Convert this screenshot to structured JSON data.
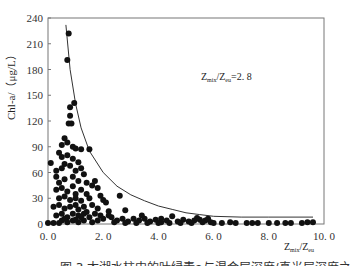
{
  "chart_data": {
    "type": "scatter",
    "title": "",
    "xlabel": "Zmix/Zeu",
    "ylabel": "Chl-a/（μg/L）",
    "xlim": [
      0,
      10
    ],
    "ylim": [
      0,
      240
    ],
    "xticks": [
      "0.0",
      "2.0",
      "4.0",
      "6.0",
      "8.0",
      "10.0"
    ],
    "yticks": [
      "0",
      "30",
      "60",
      "90",
      "120",
      "150",
      "180",
      "210",
      "240"
    ],
    "grid": false,
    "legend": null,
    "annotations": [
      {
        "text": "Zmix/Zeu=2.8",
        "x": 5.6,
        "y": 195
      }
    ],
    "series": [
      {
        "name": "observations",
        "marker": "filled-circle",
        "points": [
          [
            0.75,
            222
          ],
          [
            0.7,
            191
          ],
          [
            0.95,
            141
          ],
          [
            0.8,
            136
          ],
          [
            0.8,
            126
          ],
          [
            0.75,
            117
          ],
          [
            0.85,
            117
          ],
          [
            0.1,
            71
          ],
          [
            0.6,
            100
          ],
          [
            0.5,
            92
          ],
          [
            0.7,
            95
          ],
          [
            0.4,
            83
          ],
          [
            0.9,
            90
          ],
          [
            1.0,
            88
          ],
          [
            1.2,
            87
          ],
          [
            1.5,
            87
          ],
          [
            0.3,
            62
          ],
          [
            0.5,
            78
          ],
          [
            0.7,
            80
          ],
          [
            0.9,
            76
          ],
          [
            1.1,
            72
          ],
          [
            0.3,
            55
          ],
          [
            0.5,
            65
          ],
          [
            0.6,
            70
          ],
          [
            0.8,
            68
          ],
          [
            1.0,
            62
          ],
          [
            1.2,
            65
          ],
          [
            1.3,
            58
          ],
          [
            0.4,
            48
          ],
          [
            0.6,
            52
          ],
          [
            0.9,
            55
          ],
          [
            1.1,
            50
          ],
          [
            1.4,
            48
          ],
          [
            1.6,
            45
          ],
          [
            0.3,
            40
          ],
          [
            0.5,
            42
          ],
          [
            0.7,
            38
          ],
          [
            0.9,
            44
          ],
          [
            1.0,
            35
          ],
          [
            1.2,
            40
          ],
          [
            1.4,
            35
          ],
          [
            1.7,
            50
          ],
          [
            1.8,
            42
          ],
          [
            0.4,
            30
          ],
          [
            0.6,
            32
          ],
          [
            0.8,
            28
          ],
          [
            1.0,
            30
          ],
          [
            1.2,
            27
          ],
          [
            1.5,
            30
          ],
          [
            1.9,
            33
          ],
          [
            2.0,
            28
          ],
          [
            0.2,
            20
          ],
          [
            0.4,
            22
          ],
          [
            0.6,
            18
          ],
          [
            0.8,
            20
          ],
          [
            1.0,
            22
          ],
          [
            1.1,
            17
          ],
          [
            1.3,
            20
          ],
          [
            1.6,
            22
          ],
          [
            1.8,
            18
          ],
          [
            2.1,
            25
          ],
          [
            0.3,
            10
          ],
          [
            0.5,
            12
          ],
          [
            0.7,
            8
          ],
          [
            0.9,
            12
          ],
          [
            1.1,
            10
          ],
          [
            1.3,
            12
          ],
          [
            1.5,
            8
          ],
          [
            1.7,
            12
          ],
          [
            1.9,
            10
          ],
          [
            2.2,
            15
          ],
          [
            0.0,
            0
          ],
          [
            0.2,
            0
          ],
          [
            0.4,
            0
          ],
          [
            0.5,
            4
          ],
          [
            0.7,
            2
          ],
          [
            0.9,
            4
          ],
          [
            1.1,
            2
          ],
          [
            1.3,
            4
          ],
          [
            1.6,
            2
          ],
          [
            1.8,
            4
          ],
          [
            2.0,
            6
          ],
          [
            2.3,
            8
          ],
          [
            2.5,
            4
          ],
          [
            2.7,
            6
          ],
          [
            2.9,
            3
          ],
          [
            3.1,
            6
          ],
          [
            3.3,
            4
          ],
          [
            3.5,
            6
          ],
          [
            3.7,
            3
          ],
          [
            3.9,
            5
          ],
          [
            4.1,
            2
          ],
          [
            4.3,
            4
          ],
          [
            4.5,
            9
          ],
          [
            4.7,
            3
          ],
          [
            4.9,
            5
          ],
          [
            5.1,
            3
          ],
          [
            5.3,
            4
          ],
          [
            5.5,
            5
          ],
          [
            5.7,
            4
          ],
          [
            5.9,
            2
          ],
          [
            2.6,
            33
          ],
          [
            2.8,
            16
          ],
          [
            3.4,
            10
          ],
          [
            2.2,
            10
          ],
          [
            4.1,
            6
          ],
          [
            5.4,
            7
          ],
          [
            5.8,
            6
          ],
          [
            5.6,
            2
          ],
          [
            6.0,
            1
          ],
          [
            6.3,
            1
          ],
          [
            6.6,
            2
          ],
          [
            6.8,
            1
          ],
          [
            7.2,
            1
          ],
          [
            7.4,
            1
          ],
          [
            7.6,
            1
          ],
          [
            8.0,
            1
          ],
          [
            8.3,
            1
          ],
          [
            8.6,
            1
          ],
          [
            8.8,
            1
          ],
          [
            9.2,
            1
          ],
          [
            9.4,
            2
          ],
          [
            9.6,
            2
          ],
          [
            2.4,
            2
          ],
          [
            2.8,
            1
          ],
          [
            3.2,
            1
          ],
          [
            3.6,
            1
          ],
          [
            4.0,
            1
          ],
          [
            4.4,
            1
          ],
          [
            4.8,
            1
          ],
          [
            5.2,
            1
          ],
          [
            1.4,
            14
          ],
          [
            1.0,
            5
          ],
          [
            0.6,
            6
          ],
          [
            1.2,
            8
          ]
        ]
      },
      {
        "name": "fit-curve",
        "type": "line",
        "points": [
          [
            0.65,
            232
          ],
          [
            0.8,
            180
          ],
          [
            1.0,
            140
          ],
          [
            1.2,
            112
          ],
          [
            1.5,
            85
          ],
          [
            2.0,
            60
          ],
          [
            2.5,
            44
          ],
          [
            3.0,
            34
          ],
          [
            3.5,
            27
          ],
          [
            4.0,
            21
          ],
          [
            4.5,
            17
          ],
          [
            5.0,
            13
          ],
          [
            5.5,
            11
          ],
          [
            6.0,
            9
          ],
          [
            7.0,
            8
          ],
          [
            8.0,
            8
          ],
          [
            9.6,
            8
          ]
        ]
      }
    ]
  },
  "caption": "图 3 太湖水柱中的叶绿素a与混合层深度/真光层深度之比的关系图"
}
